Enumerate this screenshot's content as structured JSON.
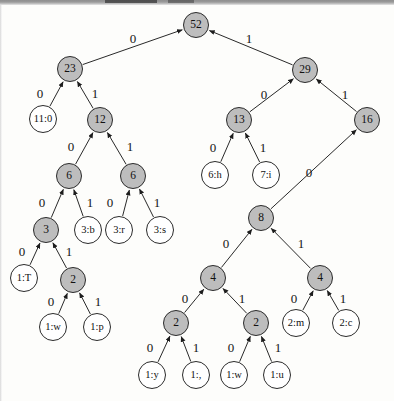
{
  "figure": {
    "kind": "huffman-code-tree",
    "colors": {
      "internal_node_fill": "#bdbdbd",
      "leaf_node_fill": "#ffffff",
      "stroke": "#2b2b2b",
      "page_background": "#fdfdfb"
    }
  },
  "chart_data": {
    "type": "tree",
    "title": "",
    "root_weight": 52,
    "edge_labels": [
      "0",
      "1"
    ],
    "nodes": [
      {
        "id": "n52",
        "label": "52",
        "kind": "internal",
        "x": 196,
        "y": 25,
        "r": 13
      },
      {
        "id": "n23",
        "label": "23",
        "kind": "internal",
        "x": 70,
        "y": 69,
        "r": 13
      },
      {
        "id": "n29",
        "label": "29",
        "kind": "internal",
        "x": 305,
        "y": 70,
        "r": 13
      },
      {
        "id": "l11_0",
        "label": "11:0",
        "kind": "leaf",
        "x": 43,
        "y": 119,
        "r": 14
      },
      {
        "id": "n12",
        "label": "12",
        "kind": "internal",
        "x": 100,
        "y": 120,
        "r": 13
      },
      {
        "id": "n13",
        "label": "13",
        "kind": "internal",
        "x": 239,
        "y": 120,
        "r": 13
      },
      {
        "id": "n16",
        "label": "16",
        "kind": "internal",
        "x": 367,
        "y": 120,
        "r": 13
      },
      {
        "id": "n6a",
        "label": "6",
        "kind": "internal",
        "x": 69,
        "y": 176,
        "r": 13
      },
      {
        "id": "n6b",
        "label": "6",
        "kind": "internal",
        "x": 133,
        "y": 176,
        "r": 13
      },
      {
        "id": "l6_h",
        "label": "6:h",
        "kind": "leaf",
        "x": 215,
        "y": 175,
        "r": 14
      },
      {
        "id": "l7_i",
        "label": "7:i",
        "kind": "leaf",
        "x": 266,
        "y": 175,
        "r": 14
      },
      {
        "id": "n3",
        "label": "3",
        "kind": "internal",
        "x": 46,
        "y": 230,
        "r": 13
      },
      {
        "id": "l3_b",
        "label": "3:b",
        "kind": "leaf",
        "x": 88,
        "y": 230,
        "r": 14
      },
      {
        "id": "l3_r",
        "label": "3:r",
        "kind": "leaf",
        "x": 119,
        "y": 230,
        "r": 14
      },
      {
        "id": "l3_s",
        "label": "3:s",
        "kind": "leaf",
        "x": 160,
        "y": 230,
        "r": 14
      },
      {
        "id": "n8",
        "label": "8",
        "kind": "internal",
        "x": 261,
        "y": 218,
        "r": 13
      },
      {
        "id": "l1_T",
        "label": "1:T",
        "kind": "leaf",
        "x": 24,
        "y": 278,
        "r": 14
      },
      {
        "id": "n2a",
        "label": "2",
        "kind": "internal",
        "x": 73,
        "y": 280,
        "r": 13
      },
      {
        "id": "n4a",
        "label": "4",
        "kind": "internal",
        "x": 213,
        "y": 278,
        "r": 13
      },
      {
        "id": "n4b",
        "label": "4",
        "kind": "internal",
        "x": 320,
        "y": 278,
        "r": 13
      },
      {
        "id": "l1_w1",
        "label": "1:w",
        "kind": "leaf",
        "x": 53,
        "y": 327,
        "r": 14
      },
      {
        "id": "l1_p",
        "label": "1:p",
        "kind": "leaf",
        "x": 97,
        "y": 327,
        "r": 14
      },
      {
        "id": "n2b",
        "label": "2",
        "kind": "internal",
        "x": 176,
        "y": 323,
        "r": 13
      },
      {
        "id": "n2c",
        "label": "2",
        "kind": "internal",
        "x": 256,
        "y": 323,
        "r": 13
      },
      {
        "id": "l2_m",
        "label": "2:m",
        "kind": "leaf",
        "x": 296,
        "y": 323,
        "r": 14
      },
      {
        "id": "l2_c",
        "label": "2:c",
        "kind": "leaf",
        "x": 346,
        "y": 323,
        "r": 14
      },
      {
        "id": "l1_y",
        "label": "1:y",
        "kind": "leaf",
        "x": 152,
        "y": 375,
        "r": 14
      },
      {
        "id": "l1_comma",
        "label": "1:,",
        "kind": "leaf",
        "x": 196,
        "y": 375,
        "r": 14
      },
      {
        "id": "l1_w2",
        "label": "1:w",
        "kind": "leaf",
        "x": 234,
        "y": 375,
        "r": 14
      },
      {
        "id": "l1_u",
        "label": "1:u",
        "kind": "leaf",
        "x": 277,
        "y": 375,
        "r": 14
      }
    ],
    "edges": [
      {
        "from": "n52",
        "to": "n23",
        "bit": "0",
        "lx": 133,
        "ly": 40
      },
      {
        "from": "n52",
        "to": "n29",
        "bit": "1",
        "lx": 249,
        "ly": 40
      },
      {
        "from": "n23",
        "to": "l11_0",
        "bit": "0",
        "lx": 40,
        "ly": 95
      },
      {
        "from": "n23",
        "to": "n12",
        "bit": "1",
        "lx": 95,
        "ly": 95
      },
      {
        "from": "n29",
        "to": "n13",
        "bit": "0",
        "lx": 264,
        "ly": 96
      },
      {
        "from": "n29",
        "to": "n16",
        "bit": "1",
        "lx": 345,
        "ly": 96
      },
      {
        "from": "n12",
        "to": "n6a",
        "bit": "0",
        "lx": 71,
        "ly": 148
      },
      {
        "from": "n12",
        "to": "n6b",
        "bit": "1",
        "lx": 130,
        "ly": 148
      },
      {
        "from": "n13",
        "to": "l6_h",
        "bit": "0",
        "lx": 213,
        "ly": 149
      },
      {
        "from": "n13",
        "to": "l7_i",
        "bit": "1",
        "lx": 263,
        "ly": 149
      },
      {
        "from": "n6a",
        "to": "n3",
        "bit": "0",
        "lx": 42,
        "ly": 204
      },
      {
        "from": "n6a",
        "to": "l3_b",
        "bit": "1",
        "lx": 90,
        "ly": 204
      },
      {
        "from": "n6b",
        "to": "l3_r",
        "bit": "0",
        "lx": 110,
        "ly": 204
      },
      {
        "from": "n6b",
        "to": "l3_s",
        "bit": "1",
        "lx": 157,
        "ly": 204
      },
      {
        "from": "n16",
        "to": "n8",
        "bit": "0",
        "lx": 309,
        "ly": 174
      },
      {
        "from": "n3",
        "to": "l1_T",
        "bit": "0",
        "lx": 22,
        "ly": 253
      },
      {
        "from": "n3",
        "to": "n2a",
        "bit": "1",
        "lx": 69,
        "ly": 253
      },
      {
        "from": "n8",
        "to": "n4a",
        "bit": "0",
        "lx": 226,
        "ly": 245
      },
      {
        "from": "n8",
        "to": "n4b",
        "bit": "1",
        "lx": 301,
        "ly": 245
      },
      {
        "from": "n2a",
        "to": "l1_w1",
        "bit": "0",
        "lx": 51,
        "ly": 303
      },
      {
        "from": "n2a",
        "to": "l1_p",
        "bit": "1",
        "lx": 98,
        "ly": 303
      },
      {
        "from": "n4a",
        "to": "n2b",
        "bit": "0",
        "lx": 185,
        "ly": 300
      },
      {
        "from": "n4a",
        "to": "n2c",
        "bit": "1",
        "lx": 242,
        "ly": 300
      },
      {
        "from": "n4b",
        "to": "l2_m",
        "bit": "0",
        "lx": 294,
        "ly": 300
      },
      {
        "from": "n4b",
        "to": "l2_c",
        "bit": "1",
        "lx": 343,
        "ly": 300
      },
      {
        "from": "n2b",
        "to": "l1_y",
        "bit": "0",
        "lx": 150,
        "ly": 349
      },
      {
        "from": "n2b",
        "to": "l1_comma",
        "bit": "1",
        "lx": 196,
        "ly": 349
      },
      {
        "from": "n2c",
        "to": "l1_w2",
        "bit": "0",
        "lx": 231,
        "ly": 349
      },
      {
        "from": "n2c",
        "to": "l1_u",
        "bit": "1",
        "lx": 278,
        "ly": 349
      }
    ]
  }
}
